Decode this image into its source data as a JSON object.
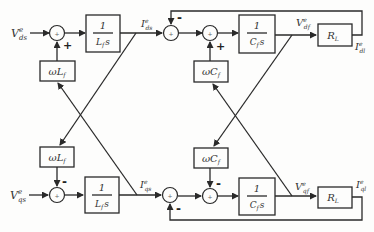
{
  "diagram": {
    "type": "control-block-diagram",
    "inputs": {
      "vds": {
        "main": "V",
        "sup": "e",
        "sub": "ds"
      },
      "vqs": {
        "main": "V",
        "sup": "e",
        "sub": "qs"
      }
    },
    "signals": {
      "ids": {
        "main": "I",
        "sup": "e",
        "sub": "ds"
      },
      "iqs": {
        "main": "I",
        "sup": "e",
        "sub": "qs"
      },
      "vdf": {
        "main": "V",
        "sup": "e",
        "sub": "df"
      },
      "vqf": {
        "main": "V",
        "sup": "e",
        "sub": "qf"
      },
      "idl": {
        "main": "I",
        "sup": "e",
        "sub": "dl"
      },
      "iql": {
        "main": "I",
        "sup": "e",
        "sub": "ql"
      }
    },
    "blocks": {
      "lf_integrator_num": "1",
      "lf_integrator_den": "L",
      "lf_integrator_den_sub": "f",
      "lf_integrator_den_s": "s",
      "cf_integrator_num": "1",
      "cf_integrator_den": "C",
      "cf_integrator_den_sub": "f",
      "cf_integrator_den_s": "s",
      "wlf": "ωL",
      "wlf_sub": "f",
      "wcf": "ωC",
      "wcf_sub": "f",
      "rl": "R",
      "rl_sub": "L"
    },
    "signs": {
      "top_sum1_bottom": "+",
      "top_sum2_top": "-",
      "top_sum3_bottom": "+",
      "bot_sum1_top": "-",
      "bot_sum2_bottom": "-",
      "bot_sum3_top": "-",
      "sum_inner": "+"
    }
  }
}
